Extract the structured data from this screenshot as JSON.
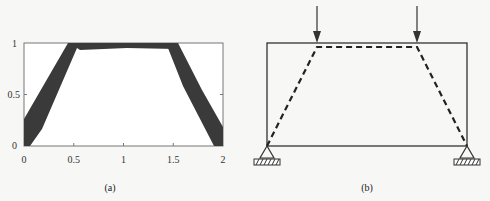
{
  "figure": {
    "panel_a": {
      "caption": "(a)",
      "x_ticks": [
        "0",
        "0.5",
        "1",
        "1.5",
        "2"
      ],
      "y_ticks": [
        "0",
        "0.5",
        "1"
      ],
      "xlim": [
        0,
        2
      ],
      "ylim": [
        0,
        1
      ],
      "band_color": "#3a3a3a",
      "description": "Topology optimization result showing dark trapezoidal strut-and-tie band"
    },
    "panel_b": {
      "caption": "(b)",
      "description": "Deep beam with two point loads on top, pin supports at bottom corners, dashed trapezoidal load path",
      "loads": 2,
      "supports": 2
    }
  }
}
